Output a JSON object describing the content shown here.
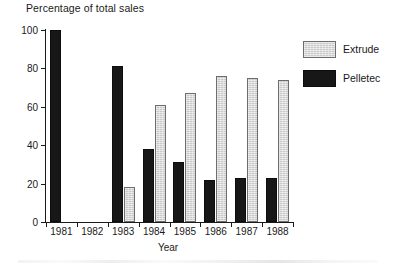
{
  "chart_data": {
    "type": "bar",
    "title": "Percentage of total sales",
    "xlabel": "Year",
    "ylabel": "",
    "categories": [
      "1981",
      "1982",
      "1983",
      "1984",
      "1985",
      "1986",
      "1987",
      "1988"
    ],
    "series": [
      {
        "name": "Pelletec",
        "color": "#171717",
        "values": [
          100,
          0,
          81,
          38,
          31,
          22,
          23,
          23
        ]
      },
      {
        "name": "Extrude",
        "color": "#c9c9c9",
        "values": [
          0,
          0,
          18,
          61,
          67,
          76,
          75,
          74
        ]
      }
    ],
    "ylim": [
      0,
      100
    ],
    "yticks": [
      0,
      20,
      40,
      60,
      80,
      100
    ],
    "ytick_labels": [
      "0",
      "20",
      "40",
      "60",
      "80",
      "100"
    ],
    "grid": false,
    "legend_position": "upper-right"
  },
  "legend": {
    "entries": [
      {
        "label": "Extrude"
      },
      {
        "label": "Pelletec"
      }
    ]
  }
}
